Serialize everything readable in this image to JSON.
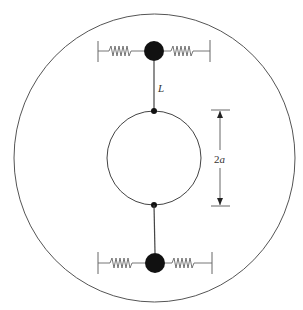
{
  "diagram": {
    "type": "mechanical-schematic",
    "colors": {
      "stroke": "#444444",
      "mass": "#111111",
      "spring": "#666666",
      "background": "#ffffff"
    },
    "labels": {
      "rod_length": "L",
      "diameter_prefix": "2",
      "diameter_var": "a"
    },
    "elements": {
      "outer_circle": {
        "cx": 154.5,
        "cy": 158,
        "rx": 140.5,
        "ry": 144
      },
      "inner_circle": {
        "cx": 154,
        "cy": 158,
        "r": 47
      },
      "top_mass": {
        "cx": 154,
        "cy": 51,
        "r": 10
      },
      "bottom_mass": {
        "cx": 155,
        "cy": 263,
        "r": 10
      },
      "top_attachment": {
        "cx": 154,
        "cy": 111,
        "r": 3
      },
      "bottom_attachment": {
        "cx": 154,
        "cy": 205,
        "r": 3
      },
      "dimension_arrow": {
        "x": 220,
        "y1": 110,
        "y2": 206
      }
    }
  }
}
